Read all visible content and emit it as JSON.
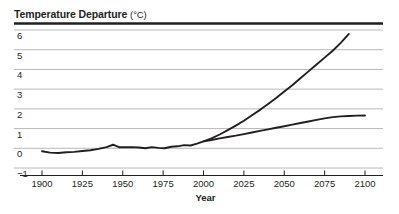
{
  "chart_data": {
    "type": "line",
    "title": "Temperature Departure",
    "title_units": "(°C)",
    "xlabel": "Year",
    "ylabel": "",
    "xlim": [
      1895,
      2105
    ],
    "ylim": [
      -1,
      6
    ],
    "grid": true,
    "legend": "none",
    "yticks": [
      6,
      5,
      4,
      3,
      2,
      1,
      0,
      -1
    ],
    "ytick_labels": [
      "6",
      "5",
      "4",
      "3",
      "2",
      "1",
      "0",
      "−1"
    ],
    "xticks": [
      1900,
      1925,
      1950,
      1975,
      2000,
      2025,
      2050,
      2075,
      2100
    ],
    "xtick_labels": [
      "1900",
      "1925",
      "1950",
      "1975",
      "2000",
      "2025",
      "2050",
      "2075",
      "2100"
    ],
    "series": [
      {
        "name": "observed-and-high-projection",
        "x": [
          1900,
          1905,
          1910,
          1915,
          1920,
          1925,
          1930,
          1935,
          1940,
          1944,
          1948,
          1952,
          1956,
          1960,
          1964,
          1968,
          1972,
          1976,
          1980,
          1984,
          1988,
          1992,
          1996,
          2000,
          2005,
          2010,
          2015,
          2020,
          2025,
          2030,
          2035,
          2040,
          2045,
          2050,
          2055,
          2060,
          2065,
          2070,
          2075,
          2080,
          2085,
          2090
        ],
        "y": [
          -0.15,
          -0.22,
          -0.24,
          -0.2,
          -0.18,
          -0.14,
          -0.1,
          -0.03,
          0.06,
          0.18,
          0.05,
          0.05,
          0.06,
          0.04,
          0.0,
          0.06,
          0.02,
          0.0,
          0.08,
          0.1,
          0.16,
          0.14,
          0.24,
          0.35,
          0.5,
          0.7,
          0.92,
          1.15,
          1.4,
          1.68,
          1.95,
          2.25,
          2.55,
          2.88,
          3.2,
          3.55,
          3.9,
          4.25,
          4.6,
          4.95,
          5.35,
          5.8
        ]
      },
      {
        "name": "low-projection",
        "x": [
          2000,
          2005,
          2010,
          2015,
          2020,
          2025,
          2030,
          2035,
          2040,
          2045,
          2050,
          2055,
          2060,
          2065,
          2070,
          2075,
          2080,
          2085,
          2090,
          2095,
          2100
        ],
        "y": [
          0.35,
          0.42,
          0.5,
          0.57,
          0.64,
          0.72,
          0.8,
          0.88,
          0.96,
          1.04,
          1.12,
          1.2,
          1.28,
          1.36,
          1.44,
          1.52,
          1.58,
          1.62,
          1.64,
          1.655,
          1.66
        ]
      }
    ],
    "colors": {
      "line": "#231f20",
      "grid": "#b9b9b9",
      "axis": "#231f20",
      "background": "#ffffff"
    }
  }
}
